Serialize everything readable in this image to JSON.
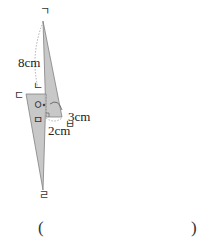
{
  "figure": {
    "vertex_labels": {
      "top": "ㄱ",
      "upper_mid": "ㄴ",
      "left": "ㄷ",
      "bottom": "ㄹ",
      "center_circle": "ㅇ",
      "lower_mid": "ㅁ",
      "right": "ㅂ"
    },
    "dimensions": {
      "slant_length": "8cm",
      "height_short": "3cm",
      "base_width": "2cm"
    },
    "colors": {
      "fill": "#c8c8c8",
      "stroke": "#7a7a7a",
      "dotted": "#9a9a9a"
    }
  },
  "answer": {
    "open_paren": "(",
    "close_paren": ")"
  }
}
